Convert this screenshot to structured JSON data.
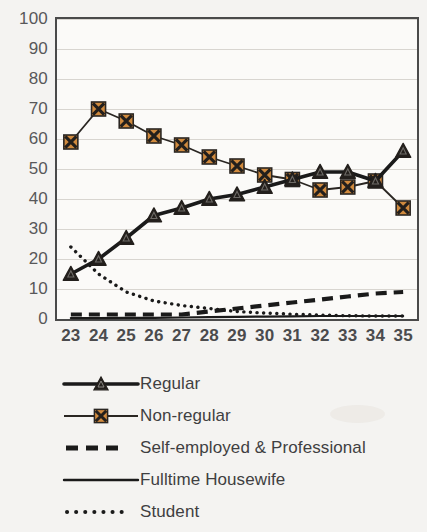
{
  "chart_data": {
    "type": "line",
    "title": "",
    "xlabel": "",
    "ylabel": "",
    "x": [
      23,
      24,
      25,
      26,
      27,
      28,
      29,
      30,
      31,
      32,
      33,
      34,
      35
    ],
    "categories": [
      "23",
      "24",
      "25",
      "26",
      "27",
      "28",
      "29",
      "30",
      "31",
      "32",
      "33",
      "34",
      "35"
    ],
    "ylim": [
      0,
      100
    ],
    "xlim": [
      23,
      35
    ],
    "yticks": [
      0,
      10,
      20,
      30,
      40,
      50,
      60,
      70,
      80,
      90,
      100
    ],
    "ytick_labels": [
      "0",
      "10",
      "20",
      "30",
      "40",
      "50",
      "60",
      "70",
      "80",
      "90",
      "100"
    ],
    "xtick_labels": [
      "23",
      "24",
      "25",
      "26",
      "27",
      "28",
      "29",
      "30",
      "31",
      "32",
      "33",
      "34",
      "35"
    ],
    "grid": "horizontal",
    "legend_position": "below",
    "series": [
      {
        "name": "Regular",
        "marker": "triangle",
        "line_style": "solid-thick",
        "color": "#1a1a1a",
        "values": [
          15,
          20,
          27,
          34.5,
          37,
          40,
          41.5,
          44,
          46.5,
          49,
          49,
          46,
          56
        ]
      },
      {
        "name": "Non-regular",
        "marker": "x-square",
        "line_style": "solid-thin",
        "color": "#d08a3e",
        "values": [
          59,
          70,
          66,
          61,
          58,
          54,
          51,
          48,
          46.5,
          43,
          44,
          46,
          37
        ]
      },
      {
        "name": "Self-employed & Professional",
        "marker": "none",
        "line_style": "dashed-thick",
        "color": "#1a1a1a",
        "values": [
          1.5,
          1.5,
          1.5,
          1.5,
          1.5,
          2.5,
          3.5,
          4.5,
          5.5,
          6.5,
          7.5,
          8.5,
          9
        ]
      },
      {
        "name": "Fulltime Housewife",
        "marker": "none",
        "line_style": "solid-thin",
        "color": "#1a1a1a",
        "values": [
          0.3,
          0.3,
          0.4,
          0.4,
          0.5,
          0.6,
          0.7,
          0.8,
          0.9,
          1.0,
          1.0,
          1.0,
          1.0
        ]
      },
      {
        "name": "Student",
        "marker": "none",
        "line_style": "dotted",
        "color": "#1a1a1a",
        "values": [
          24,
          15,
          9,
          6,
          4.5,
          3.5,
          2.5,
          2,
          1.6,
          1.3,
          1.1,
          1.0,
          1.0
        ]
      }
    ]
  },
  "legend": {
    "items": [
      {
        "label": "Regular"
      },
      {
        "label": "Non-regular"
      },
      {
        "label": "Self-employed & Professional"
      },
      {
        "label": "Fulltime Housewife"
      },
      {
        "label": "Student"
      }
    ]
  },
  "colors": {
    "marker_orange": "#d08a3e",
    "marker_dark": "#231f1c",
    "line_dark": "#1a1a1a",
    "axis": "#4a4a4a",
    "grid": "#d8d5d0",
    "tick_text": "#58585a",
    "background": "#f4f3f1",
    "plot_background": "#fbfaf8"
  }
}
